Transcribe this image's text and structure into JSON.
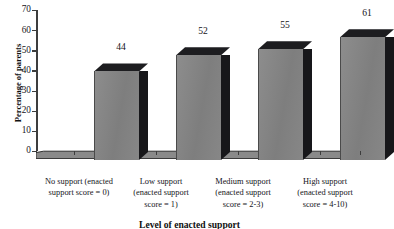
{
  "chart_data": {
    "type": "bar",
    "title": "",
    "xlabel": "Level of enacted support",
    "ylabel": "Percentage of parents",
    "ylim": [
      0,
      70
    ],
    "yticks": [
      0,
      10,
      20,
      30,
      40,
      50,
      60,
      70
    ],
    "grid": false,
    "legend": false,
    "style": "3d-bar-grayscale",
    "categories": [
      "No support (enacted support score = 0)",
      "Low support (enacted support score = 1)",
      "Medium support (enacted support score = 2-3)",
      "High support (enacted support score = 4-10)"
    ],
    "category_lines": [
      [
        "No support (enacted",
        "support score = 0)"
      ],
      [
        "Low support",
        "(enacted support",
        "score = 1)"
      ],
      [
        "Medium support",
        "(enacted support",
        "score = 2-3)"
      ],
      [
        "High support",
        "(enacted support",
        "score = 4-10)"
      ]
    ],
    "values": [
      44,
      52,
      55,
      61
    ],
    "value_labels": [
      "44",
      "52",
      "55",
      "61"
    ],
    "colors": {
      "bar_front": "#858585",
      "bar_side": "#17171a",
      "bar_top": "#1d1d20",
      "axis": "#3d3d3d",
      "text": "#14141a",
      "background": "#ffffff"
    }
  },
  "axes": {
    "y_tick_labels": [
      "70",
      "60",
      "50",
      "40",
      "30",
      "20",
      "10",
      "0"
    ]
  }
}
